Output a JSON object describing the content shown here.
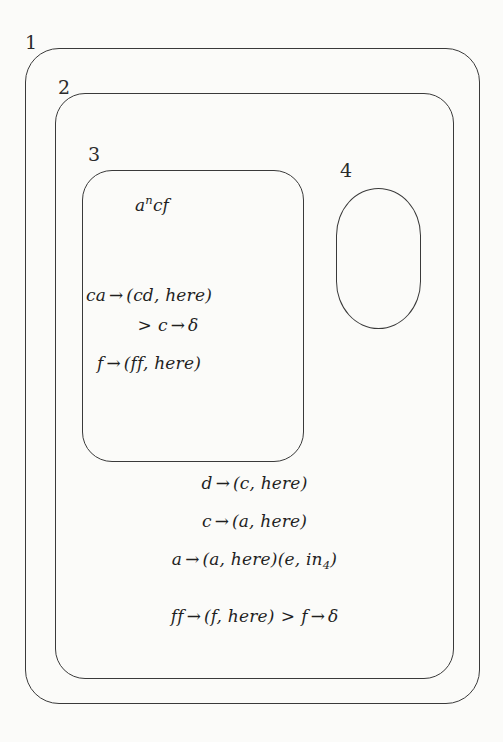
{
  "figure": {
    "type": "p-system-membrane-diagram",
    "background_color": "#fbfbf9",
    "line_color": "#3a3a3a",
    "text_color": "#1f1f1f"
  },
  "membranes": [
    {
      "id": 1,
      "label": "1",
      "shape": "rounded-rectangle",
      "parent": null
    },
    {
      "id": 2,
      "label": "2",
      "shape": "rounded-rectangle",
      "parent": 1
    },
    {
      "id": 3,
      "label": "3",
      "shape": "rounded-rectangle",
      "parent": 2
    },
    {
      "id": 4,
      "label": "4",
      "shape": "stadium-oval",
      "parent": 2
    }
  ],
  "region3": {
    "multiset": {
      "base": "a",
      "exponent": "n",
      "rest": "cf"
    },
    "rules": [
      {
        "lhs": "ca",
        "arrow": "→",
        "rhs": "(cd, here)"
      },
      {
        "priority": ">",
        "lhs": "c",
        "arrow": "→",
        "rhs": "δ"
      },
      {
        "lhs": "f",
        "arrow": "→",
        "rhs": "(ff, here)"
      }
    ]
  },
  "region2": {
    "rules": [
      {
        "lhs": "d",
        "arrow": "→",
        "rhs": "(c, here)"
      },
      {
        "lhs": "c",
        "arrow": "→",
        "rhs": "(a, here)"
      },
      {
        "lhs": "a",
        "arrow": "→",
        "rhs_first": "(a, here)",
        "rhs_second_open": "(e, in",
        "rhs_second_sub": "4",
        "rhs_second_close": ")"
      },
      {
        "lhs": "ff",
        "arrow": "→",
        "rhs": "(f, here)",
        "priority": ">",
        "lhs2": "f",
        "arrow2": "→",
        "rhs2": "δ"
      }
    ]
  },
  "region4": {
    "contents": ""
  }
}
